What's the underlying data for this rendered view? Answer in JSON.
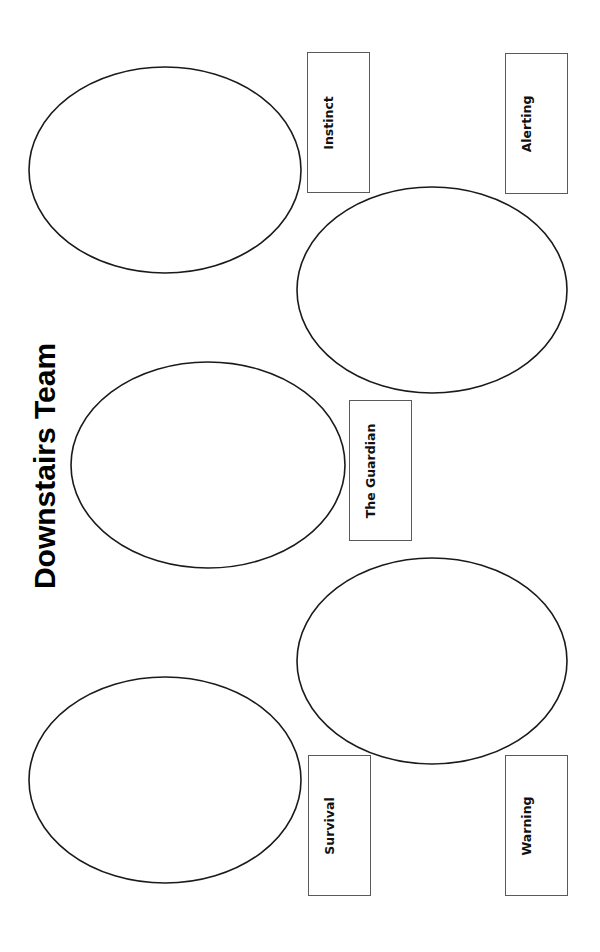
{
  "title": "Downstairs Team",
  "labels": {
    "instinct": "Instinct",
    "alerting": "Alerting",
    "guardian": "The Guardian",
    "survival": "Survival",
    "warning": "Warning"
  },
  "colors": {
    "ellipse_stroke": "#1a1a1a",
    "box_border": "#5a5a5a",
    "text": "#111111"
  }
}
